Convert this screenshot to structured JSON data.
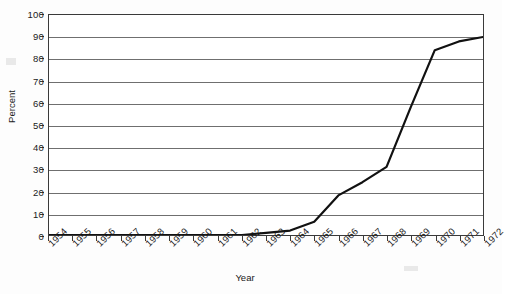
{
  "chart_data": {
    "type": "line",
    "title": "",
    "xlabel": "Year",
    "ylabel": "Percent",
    "grid": "horizontal",
    "legend": "none",
    "xlim": [
      1954,
      1972
    ],
    "ylim": [
      0,
      100
    ],
    "ytick_step": 10,
    "yticks": [
      0,
      10,
      20,
      30,
      40,
      50,
      60,
      70,
      80,
      90,
      100
    ],
    "categories": [
      "1954",
      "1955",
      "1956",
      "1957",
      "1958",
      "1959",
      "1960",
      "1961",
      "1962",
      "1963",
      "1964",
      "1965",
      "1966",
      "1967",
      "1968",
      "1969",
      "1970",
      "1971",
      "1972"
    ],
    "values": [
      0,
      0,
      0,
      0,
      0,
      0,
      0,
      0,
      0,
      1,
      2,
      6,
      18,
      24,
      31,
      58,
      84,
      88,
      90
    ],
    "series": [
      {
        "name": "Percent",
        "color": "#111111",
        "values": [
          0,
          0,
          0,
          0,
          0,
          0,
          0,
          0,
          0,
          1,
          2,
          6,
          18,
          24,
          31,
          58,
          84,
          88,
          90
        ]
      }
    ],
    "annotations": []
  },
  "axes": {
    "y_title": "Percent",
    "x_title": "Year"
  }
}
